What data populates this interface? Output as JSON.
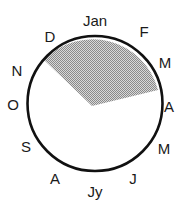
{
  "diagram": {
    "type": "year-circle",
    "circle": {
      "cx": 95,
      "cy": 103.5,
      "r": 67.5,
      "stroke": "#111111"
    },
    "shaded_region": {
      "fill": "#bdbdbd",
      "from_month": "N",
      "to_month": "A",
      "start_point": [
        44,
        60
      ],
      "vertex": [
        92,
        106
      ],
      "end_point": [
        158,
        90
      ]
    },
    "months": [
      {
        "label": "Jan",
        "x": 95,
        "y": 20
      },
      {
        "label": "F",
        "x": 144,
        "y": 31
      },
      {
        "label": "M",
        "x": 165,
        "y": 62
      },
      {
        "label": "A",
        "x": 169,
        "y": 106
      },
      {
        "label": "M",
        "x": 164,
        "y": 148
      },
      {
        "label": "J",
        "x": 133,
        "y": 178
      },
      {
        "label": "Jy",
        "x": 95,
        "y": 191
      },
      {
        "label": "A",
        "x": 55,
        "y": 178
      },
      {
        "label": "S",
        "x": 26,
        "y": 146
      },
      {
        "label": "O",
        "x": 13,
        "y": 104
      },
      {
        "label": "N",
        "x": 17,
        "y": 70
      },
      {
        "label": "D",
        "x": 50,
        "y": 36
      }
    ]
  }
}
